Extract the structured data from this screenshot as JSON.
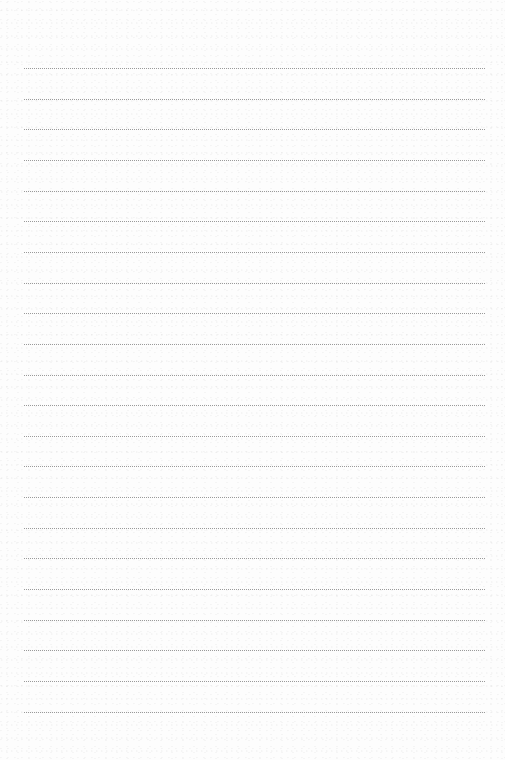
{
  "page": {
    "type": "blank lined paper",
    "line_style": "dotted",
    "line_color": "#9a9a9a",
    "background_color": "#fdfdfd",
    "line_count": 22,
    "first_line_y": 68,
    "line_spacing": 30.65,
    "line_left": 24,
    "line_width": 461
  }
}
